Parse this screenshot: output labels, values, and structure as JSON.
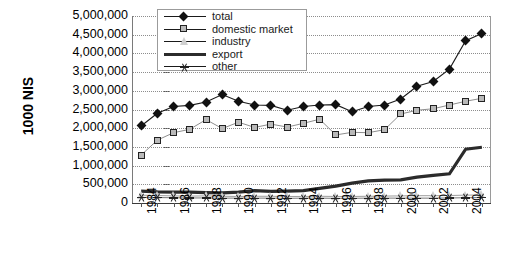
{
  "axes": {
    "y_title": "1000 NIS",
    "y_ticks": [
      "5,000,000",
      "4,500,000",
      "4,000,000",
      "3,500,000",
      "3,000,000",
      "2,500,000",
      "2,000,000",
      "1,500,000",
      "1,000,000",
      "500,000",
      "0"
    ],
    "x_ticks": [
      "1984",
      "1986",
      "1988",
      "1990",
      "1992",
      "1994",
      "1996",
      "1998",
      "2000",
      "2002",
      "2004"
    ]
  },
  "legend": {
    "items": [
      {
        "label": "total",
        "marker": "diamond",
        "color": "#111111"
      },
      {
        "label": "domestic market",
        "marker": "square",
        "color": "#b9b9b9"
      },
      {
        "label": "industry",
        "marker": "triangle",
        "color": "#cfcfcf"
      },
      {
        "label": "export",
        "marker": "thick-line",
        "color": "#2b2b2b"
      },
      {
        "label": "other",
        "marker": "star",
        "color": "#222222"
      }
    ]
  },
  "chart_data": {
    "type": "line",
    "title": "",
    "xlabel": "",
    "ylabel": "1000 NIS",
    "ylim": [
      0,
      5000000
    ],
    "ytick_step": 500000,
    "grid": true,
    "legend_position": "top-left-inside",
    "x": [
      1984,
      1985,
      1986,
      1987,
      1988,
      1989,
      1990,
      1991,
      1992,
      1993,
      1994,
      1995,
      1996,
      1997,
      1998,
      1999,
      2000,
      2001,
      2002,
      2003,
      2004,
      2005
    ],
    "series": [
      {
        "name": "total",
        "marker": "diamond",
        "values": [
          2060000,
          2400000,
          2580000,
          2610000,
          2700000,
          2900000,
          2720000,
          2620000,
          2610000,
          2480000,
          2580000,
          2620000,
          2630000,
          2440000,
          2580000,
          2620000,
          2780000,
          3120000,
          3250000,
          3580000,
          4340000,
          4530000
        ]
      },
      {
        "name": "domestic market",
        "marker": "square",
        "values": [
          1280000,
          1680000,
          1880000,
          1970000,
          2230000,
          1990000,
          2160000,
          2020000,
          2110000,
          2030000,
          2130000,
          2240000,
          1820000,
          1890000,
          1880000,
          1960000,
          2380000,
          2480000,
          2520000,
          2620000,
          2720000,
          2800000
        ]
      },
      {
        "name": "industry",
        "marker": "triangle",
        "values": [
          210000,
          200000,
          190000,
          185000,
          190000,
          180000,
          175000,
          180000,
          180000,
          175000,
          175000,
          180000,
          175000,
          175000,
          180000,
          185000,
          190000,
          195000,
          195000,
          200000,
          210000,
          215000
        ]
      },
      {
        "name": "export",
        "marker": "thick-line",
        "values": [
          320000,
          300000,
          290000,
          290000,
          280000,
          270000,
          290000,
          330000,
          310000,
          320000,
          330000,
          390000,
          450000,
          530000,
          590000,
          610000,
          620000,
          690000,
          740000,
          780000,
          1440000,
          1490000
        ]
      },
      {
        "name": "other",
        "marker": "star",
        "values": [
          150000,
          145000,
          140000,
          135000,
          135000,
          130000,
          130000,
          130000,
          130000,
          125000,
          130000,
          130000,
          125000,
          125000,
          130000,
          130000,
          130000,
          130000,
          130000,
          135000,
          140000,
          145000
        ]
      }
    ]
  }
}
